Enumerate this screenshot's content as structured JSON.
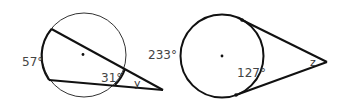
{
  "figures": [
    {
      "id": "left",
      "type": "two-secants",
      "labels": {
        "far_arc": "57°",
        "near_arc": "31°",
        "angle": "y"
      }
    },
    {
      "id": "right",
      "type": "two-tangents",
      "labels": {
        "major_arc": "233°",
        "minor_arc": "127°",
        "angle": "z"
      }
    }
  ],
  "colors": {
    "stroke": "#111111",
    "circle_stroke": "#333333",
    "text": "#444444"
  }
}
